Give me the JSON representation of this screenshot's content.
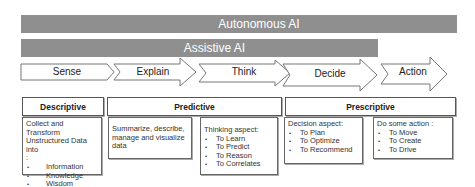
{
  "bars": {
    "autonomous": "Autonomous AI",
    "assistive": "Assistive AI"
  },
  "stages": [
    {
      "label": "Sense"
    },
    {
      "label": "Explain"
    },
    {
      "label": "Think"
    },
    {
      "label": "Decide"
    },
    {
      "label": "Action"
    }
  ],
  "categories": [
    {
      "label": "Descriptive"
    },
    {
      "label": "Predictive"
    },
    {
      "label": "Prescriptive"
    }
  ],
  "boxes": {
    "sense": {
      "heading": "Collect and Transform Unstructured Data into",
      "colon": ":",
      "items": [
        "Information",
        "Knowledge",
        "Wisdom"
      ]
    },
    "explain": {
      "text": "Summarize, describe, manage and visualize data"
    },
    "think": {
      "heading": "Thinking aspect:",
      "items": [
        "To Learn",
        "To Predict",
        "To Reason",
        "To Correlates"
      ]
    },
    "decide": {
      "heading": "Decision aspect:",
      "items": [
        "To Plan",
        "To Optimize",
        "To Recommend"
      ]
    },
    "action": {
      "heading": "Do some action :",
      "items": [
        "To Move",
        "To Create",
        "To Drive"
      ]
    }
  },
  "colors": {
    "bar": "#8f8f8f",
    "bar_text": "#ffffff",
    "outline": "#666666"
  }
}
